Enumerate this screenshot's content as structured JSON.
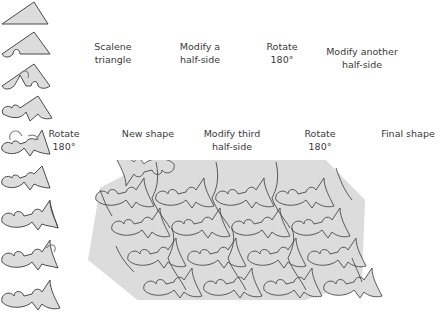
{
  "colors": {
    "fill": "#dcdcdc",
    "stroke": "#4a4a4a",
    "arrow": "#888888",
    "background": "#ffffff"
  },
  "steps": [
    {
      "label_line1": "Scalene",
      "label_line2": "triangle"
    },
    {
      "label_line1": "Modify a",
      "label_line2": "half-side"
    },
    {
      "label_line1": "Rotate",
      "label_line2": "180°"
    },
    {
      "label_line1": "Modify another",
      "label_line2": "half-side"
    },
    {
      "label_line1": "Rotate",
      "label_line2": "180°"
    },
    {
      "label_line1": "New shape",
      "label_line2": ""
    },
    {
      "label_line1": "Modify third",
      "label_line2": "half-side"
    },
    {
      "label_line1": "Rotate",
      "label_line2": "180°"
    },
    {
      "label_line1": "Final shape",
      "label_line2": ""
    }
  ],
  "tessellation": {
    "rows": 4,
    "columns": 4,
    "description": "Tessellation of the final shape in a parallelogram arrangement"
  }
}
